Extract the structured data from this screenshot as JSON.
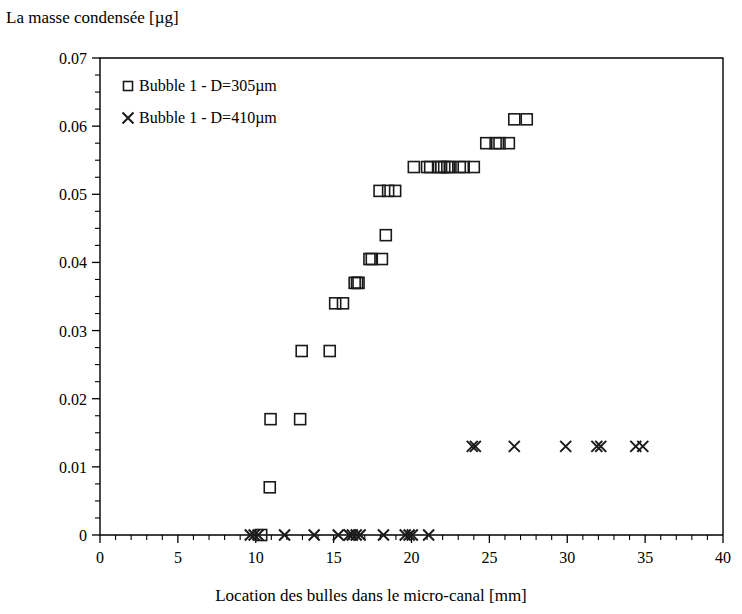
{
  "chart_data": {
    "type": "scatter",
    "title": "",
    "ylabel": "La masse condensée [µg]",
    "xlabel": "Location des bulles dans le micro-canal [mm]",
    "xlim": [
      0,
      40
    ],
    "ylim": [
      0,
      0.07
    ],
    "x_ticks": [
      "0",
      "5",
      "10",
      "15",
      "20",
      "25",
      "30",
      "35",
      "40"
    ],
    "x_tick_values": [
      0,
      5,
      10,
      15,
      20,
      25,
      30,
      35,
      40
    ],
    "x_minor_interval": 1,
    "y_ticks": [
      "0",
      "0.01",
      "0.02",
      "0.03",
      "0.04",
      "0.05",
      "0.06",
      "0.07"
    ],
    "y_tick_values": [
      0,
      0.01,
      0.02,
      0.03,
      0.04,
      0.05,
      0.06,
      0.07
    ],
    "y_minor_interval": 0.0025,
    "grid": false,
    "legend_position": "upper-left-inside",
    "marker_color": "#1a1a1a",
    "series": [
      {
        "name": "Bubble 1 - D=305µm",
        "marker": "square",
        "points": [
          [
            10.35,
            0.0
          ],
          [
            10.9,
            0.007
          ],
          [
            10.95,
            0.017
          ],
          [
            12.85,
            0.017
          ],
          [
            12.95,
            0.027
          ],
          [
            14.75,
            0.027
          ],
          [
            15.1,
            0.034
          ],
          [
            15.6,
            0.034
          ],
          [
            16.35,
            0.037
          ],
          [
            16.5,
            0.037
          ],
          [
            16.6,
            0.037
          ],
          [
            17.3,
            0.0405
          ],
          [
            17.45,
            0.0405
          ],
          [
            18.1,
            0.0405
          ],
          [
            18.35,
            0.044
          ],
          [
            17.95,
            0.0505
          ],
          [
            18.5,
            0.0505
          ],
          [
            18.95,
            0.0505
          ],
          [
            20.15,
            0.054
          ],
          [
            21.0,
            0.054
          ],
          [
            21.2,
            0.054
          ],
          [
            21.75,
            0.054
          ],
          [
            21.9,
            0.054
          ],
          [
            22.1,
            0.054
          ],
          [
            22.3,
            0.054
          ],
          [
            22.5,
            0.054
          ],
          [
            23.1,
            0.054
          ],
          [
            23.35,
            0.054
          ],
          [
            24.0,
            0.054
          ],
          [
            24.8,
            0.0575
          ],
          [
            25.4,
            0.0575
          ],
          [
            25.65,
            0.0575
          ],
          [
            26.25,
            0.0575
          ],
          [
            26.6,
            0.061
          ],
          [
            27.4,
            0.061
          ]
        ]
      },
      {
        "name": "Bubble 1 - D=410µm",
        "marker": "cross",
        "points": [
          [
            9.65,
            0.0
          ],
          [
            9.9,
            0.0
          ],
          [
            10.15,
            0.0
          ],
          [
            11.85,
            0.0
          ],
          [
            13.75,
            0.0
          ],
          [
            15.3,
            0.0
          ],
          [
            16.0,
            0.0
          ],
          [
            16.2,
            0.0
          ],
          [
            16.45,
            0.0
          ],
          [
            16.7,
            0.0
          ],
          [
            18.2,
            0.0
          ],
          [
            19.6,
            0.0
          ],
          [
            19.85,
            0.0
          ],
          [
            20.05,
            0.0
          ],
          [
            21.1,
            0.0
          ],
          [
            23.9,
            0.013
          ],
          [
            24.1,
            0.013
          ],
          [
            26.6,
            0.013
          ],
          [
            29.9,
            0.013
          ],
          [
            31.9,
            0.013
          ],
          [
            32.15,
            0.013
          ],
          [
            34.4,
            0.013
          ],
          [
            34.85,
            0.013
          ]
        ]
      }
    ]
  },
  "legend": {
    "items": [
      {
        "label": "Bubble 1 - D=305µm",
        "marker": "square"
      },
      {
        "label": "Bubble 1 - D=410µm",
        "marker": "cross"
      }
    ]
  }
}
